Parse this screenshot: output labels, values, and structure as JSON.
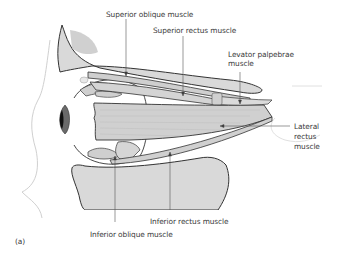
{
  "figure": {
    "panel_label": "(a)",
    "colors": {
      "bone_fill": "#d9d9d9",
      "bone_dark_patch": "#c4c4c4",
      "muscle_fill": "#cfcfcf",
      "muscle_light": "#dedede",
      "outline": "#333333",
      "skin_outline": "#d0d0d0",
      "leader_line": "#555555",
      "pupil": "#111111",
      "text": "#3a3a3a"
    },
    "labels": {
      "superior_oblique": "Superior oblique muscle",
      "superior_rectus": "Superior rectus muscle",
      "levator_palpebrae_line1": "Levator palpebrae",
      "levator_palpebrae_line2": "muscle",
      "lateral_rectus_line1": "Lateral",
      "lateral_rectus_line2": "rectus",
      "lateral_rectus_line3": "muscle",
      "inferior_rectus": "Inferior rectus muscle",
      "inferior_oblique": "Inferior oblique muscle"
    }
  }
}
